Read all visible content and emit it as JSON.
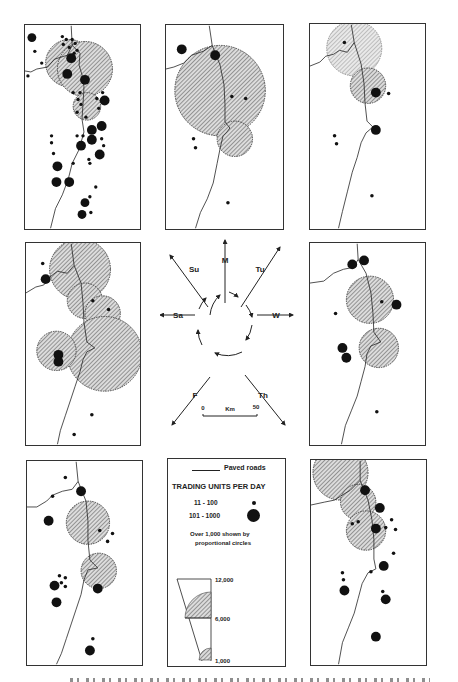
{
  "figure": {
    "colors": {
      "ink": "#111111",
      "hatch": "#555555",
      "hatch_bg": "#d8d8d8",
      "border": "#333333"
    }
  },
  "maps": [
    {
      "id": "sunday",
      "day": "Su",
      "position": "top-left",
      "large_circles": 3,
      "medium_circles": 0
    },
    {
      "id": "monday",
      "day": "M",
      "position": "top-center",
      "large_circles": 2,
      "medium_circles": 0
    },
    {
      "id": "tuesday",
      "day": "Tu",
      "position": "top-right",
      "large_circles": 2,
      "medium_circles": 0
    },
    {
      "id": "saturday",
      "day": "Sa",
      "position": "middle-left",
      "large_circles": 4,
      "medium_circles": 0
    },
    {
      "id": "wednesday",
      "day": "W",
      "position": "middle-right",
      "large_circles": 2,
      "medium_circles": 0
    },
    {
      "id": "friday",
      "day": "F",
      "position": "bottom-left",
      "large_circles": 2,
      "medium_circles": 0
    },
    {
      "id": "thursday",
      "day": "Th",
      "position": "bottom-right",
      "large_circles": 3,
      "medium_circles": 0
    }
  ],
  "compass": {
    "labels": {
      "M": "M",
      "Tu": "Tu",
      "W": "W",
      "Th": "Th",
      "F": "F",
      "Sa": "Sa",
      "Su": "Su"
    },
    "cycle_direction": "clockwise",
    "scale": {
      "start": "0",
      "unit": "Km",
      "end": "50"
    }
  },
  "legend": {
    "roads_label": "Paved roads",
    "title": "TRADING UNITS PER DAY",
    "classes": [
      {
        "range": "11 - 100",
        "symbol": "small-dot"
      },
      {
        "range": "101 - 1000",
        "symbol": "large-dot"
      }
    ],
    "note_line1": "Over 1,000 shown by",
    "note_line2": "proportional circles",
    "proportional_scale": [
      "12,000",
      "6,000",
      "1,000"
    ]
  }
}
